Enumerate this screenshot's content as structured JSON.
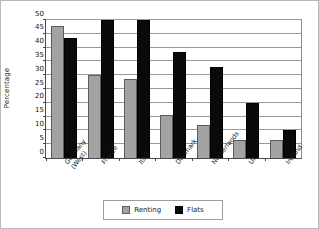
{
  "chart_data": {
    "type": "bar",
    "title": "",
    "xlabel": "",
    "ylabel": "Percentage",
    "ylim": [
      0,
      50
    ],
    "yticks": [
      0,
      5,
      10,
      15,
      20,
      25,
      30,
      35,
      40,
      45,
      50
    ],
    "ytick_labels": [
      "0",
      "5",
      "10",
      "15",
      "20",
      "25",
      "30",
      "35",
      "40",
      "45",
      "50"
    ],
    "grid": true,
    "legend_position": "bottom",
    "categories": [
      "Germany\n(West)",
      "France",
      "Italy",
      "Denmark",
      "Netherlands",
      "Uk",
      "Ireland"
    ],
    "category_lines": [
      [
        "Germany",
        "(West)"
      ],
      [
        "France"
      ],
      [
        "Italy"
      ],
      [
        "Denmark"
      ],
      [
        "Netherlands"
      ],
      [
        "Uk"
      ],
      [
        "Ireland"
      ]
    ],
    "series": [
      {
        "name": "Renting",
        "color": "#a3a3a3",
        "values": [
          48,
          30,
          28.5,
          15.5,
          12,
          6.5,
          6.5
        ]
      },
      {
        "name": "Flats",
        "color": "#0a0a0a",
        "values": [
          43.5,
          50,
          50,
          38.5,
          33,
          20,
          10
        ]
      }
    ]
  },
  "legend": {
    "items": [
      {
        "label": "Renting",
        "color": "#a3a3a3"
      },
      {
        "label": "Flats",
        "color": "#0a0a0a"
      }
    ]
  }
}
